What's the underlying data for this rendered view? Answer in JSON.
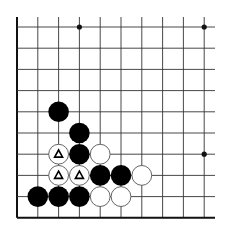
{
  "board": {
    "description": "Go board corner diagram (lower-left), Black to play / problem",
    "origin_x": 17,
    "origin_y": 27,
    "spacing_x": 20.8,
    "spacing_y": 21.2,
    "cols": 10,
    "rows": 10,
    "left_edge": true,
    "bottom_edge": true,
    "line_extend_right": 215,
    "line_extend_top": 17,
    "colors": {
      "line": "#333333",
      "edge": "#111111",
      "black_stone": "#000000",
      "white_stone": "#ffffff",
      "stone_outline": "#555555"
    },
    "star_points": [
      [
        3,
        0
      ],
      [
        9,
        0
      ],
      [
        9,
        6
      ]
    ],
    "stones": [
      {
        "col": 2,
        "row": 4,
        "color": "black"
      },
      {
        "col": 3,
        "row": 5,
        "color": "black"
      },
      {
        "col": 2,
        "row": 6,
        "color": "white",
        "mark": "triangle"
      },
      {
        "col": 3,
        "row": 6,
        "color": "black"
      },
      {
        "col": 4,
        "row": 6,
        "color": "white"
      },
      {
        "col": 2,
        "row": 7,
        "color": "white",
        "mark": "triangle"
      },
      {
        "col": 3,
        "row": 7,
        "color": "white",
        "mark": "triangle"
      },
      {
        "col": 4,
        "row": 7,
        "color": "black"
      },
      {
        "col": 5,
        "row": 7,
        "color": "black"
      },
      {
        "col": 6,
        "row": 7,
        "color": "white"
      },
      {
        "col": 1,
        "row": 8,
        "color": "black"
      },
      {
        "col": 2,
        "row": 8,
        "color": "black"
      },
      {
        "col": 3,
        "row": 8,
        "color": "black"
      },
      {
        "col": 4,
        "row": 8,
        "color": "white"
      },
      {
        "col": 5,
        "row": 8,
        "color": "white"
      }
    ]
  }
}
